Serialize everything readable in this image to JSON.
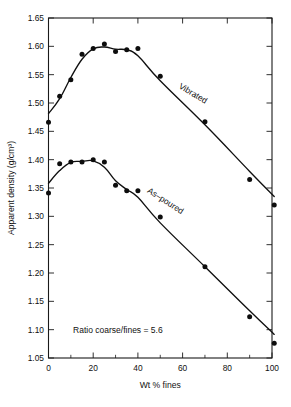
{
  "chart_data": {
    "type": "scatter",
    "title": "",
    "xlabel": "Wt % fines",
    "ylabel": "Apparent density (g/cm³)",
    "xlim": [
      0,
      100
    ],
    "ylim": [
      1.05,
      1.65
    ],
    "xticks": [
      0,
      20,
      40,
      60,
      80,
      100
    ],
    "xtick_labels": [
      "0",
      "20",
      "40",
      "60",
      "80",
      "100"
    ],
    "x_minor_step": 10,
    "yticks": [
      1.05,
      1.1,
      1.15,
      1.2,
      1.25,
      1.3,
      1.35,
      1.4,
      1.45,
      1.5,
      1.55,
      1.6,
      1.65
    ],
    "ytick_labels": [
      "1.05",
      "1.10",
      "1.15",
      "1.20",
      "1.25",
      "1.30",
      "1.35",
      "1.40",
      "1.45",
      "1.50",
      "1.55",
      "1.60",
      "1.65"
    ],
    "grid": false,
    "legend_position": "inline-curve-labels",
    "series": [
      {
        "name": "Vibrated",
        "label": "Vibrated",
        "label_x": 58,
        "label_y": 1.527,
        "label_rotation": 31,
        "marker": "filled-circle",
        "x": [
          0,
          5,
          10,
          15,
          20,
          25,
          30,
          35,
          40,
          50,
          70,
          90,
          101
        ],
        "y": [
          1.466,
          1.512,
          1.541,
          1.586,
          1.596,
          1.604,
          1.591,
          1.594,
          1.596,
          1.547,
          1.467,
          1.365,
          1.32
        ]
      },
      {
        "name": "As-poured",
        "label": "As–poured",
        "label_x": 44,
        "label_y": 1.343,
        "label_rotation": 33,
        "marker": "filled-circle",
        "x": [
          0,
          5,
          10,
          15,
          20,
          25,
          30,
          35,
          40,
          50,
          70,
          90,
          101
        ],
        "y": [
          1.341,
          1.393,
          1.396,
          1.396,
          1.4,
          1.396,
          1.355,
          1.345,
          1.345,
          1.299,
          1.211,
          1.123,
          1.076
        ]
      }
    ],
    "annotations": [
      {
        "name": "ratio-annotation",
        "text": "Ratio coarse/fines = 5.6",
        "x": 11,
        "y": 1.094
      }
    ]
  }
}
